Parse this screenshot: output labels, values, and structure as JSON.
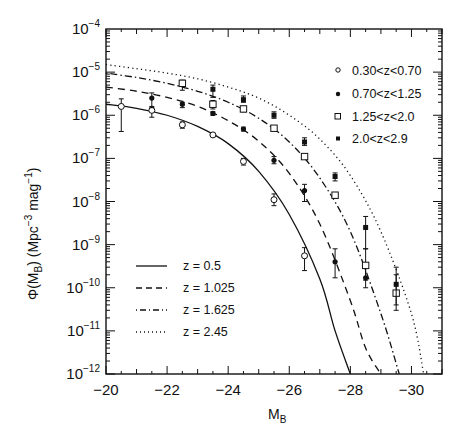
{
  "chart_data": {
    "type": "line",
    "title": "",
    "xlabel": "M_B",
    "ylabel": "Φ(M_B) (Mpc^-3 mag^-1)",
    "xlim": [
      -20,
      -31
    ],
    "ylim": [
      1e-12,
      0.0001
    ],
    "yscale": "log",
    "grid": false,
    "x_ticks": [
      -20,
      -22,
      -24,
      -26,
      -28,
      -30
    ],
    "y_ticks": [
      -12,
      -11,
      -10,
      -9,
      -8,
      -7,
      -6,
      -5,
      -4
    ],
    "model_curves": [
      {
        "name": "z = 0.5",
        "style": "solid",
        "x": [
          -20,
          -21,
          -22,
          -23,
          -24,
          -25,
          -26,
          -27,
          -27.5,
          -28
        ],
        "y": [
          1.8e-06,
          1.45e-06,
          1e-06,
          5.5e-07,
          2.2e-07,
          5e-08,
          5e-09,
          1.6e-10,
          1e-11,
          1e-12
        ]
      },
      {
        "name": "z = 1.025",
        "style": "dashed",
        "x": [
          -20,
          -21,
          -22,
          -23,
          -24,
          -25,
          -26,
          -27,
          -28,
          -28.5,
          -29.0
        ],
        "y": [
          4.5e-06,
          3.6e-06,
          2.6e-06,
          1.6e-06,
          7.5e-07,
          2.5e-07,
          4.5e-08,
          3e-09,
          5e-11,
          4e-12,
          1e-12
        ]
      },
      {
        "name": "z = 1.625",
        "style": "dashdot",
        "x": [
          -20,
          -21,
          -22,
          -23,
          -24,
          -25,
          -26,
          -27,
          -28,
          -29,
          -29.6
        ],
        "y": [
          9.5e-06,
          7.5e-06,
          5.5e-06,
          3.6e-06,
          2e-06,
          8.5e-07,
          2.4e-07,
          3.5e-08,
          2e-09,
          2.5e-11,
          1e-12
        ]
      },
      {
        "name": "z = 2.45",
        "style": "dotted",
        "x": [
          -20,
          -21,
          -22,
          -23,
          -24,
          -25,
          -26,
          -27,
          -28,
          -29,
          -30,
          -30.4
        ],
        "y": [
          1.5e-05,
          1.2e-05,
          9.5e-06,
          7e-06,
          4.5e-06,
          2.5e-06,
          1e-06,
          2.8e-07,
          4e-08,
          2e-09,
          2.5e-11,
          1e-12
        ]
      }
    ],
    "data_series": [
      {
        "name": "0.30<z<0.70",
        "marker": "open-circle",
        "x": [
          -20.5,
          -21.5,
          -22.5,
          -23.5,
          -24.5,
          -25.5,
          -26.5
        ],
        "y": [
          1.6e-06,
          1.3e-06,
          6e-07,
          3.5e-07,
          8.5e-08,
          1.1e-08,
          5.5e-10
        ],
        "err_lo": [
          4.2e-07,
          9e-07,
          5e-07,
          3.2e-07,
          7e-08,
          8e-09,
          2.5e-10
        ],
        "err_hi": [
          2.4e-06,
          1.6e-06,
          7e-07,
          3.8e-07,
          1e-07,
          1.5e-08,
          8.5e-10
        ]
      },
      {
        "name": "0.70<z<1.25",
        "marker": "filled-circle",
        "x": [
          -21.5,
          -22.5,
          -23.5,
          -24.5,
          -25.5,
          -26.5,
          -27.5,
          -28.5
        ],
        "y": [
          2.5e-06,
          1.8e-06,
          1.1e-06,
          4.8e-07,
          9e-08,
          1.8e-08,
          4e-10,
          1.7e-10
        ],
        "err_lo": [
          1.5e-06,
          1.5e-06,
          1e-06,
          4.3e-07,
          7.5e-08,
          1e-08,
          1.7e-10,
          1e-10
        ],
        "err_hi": [
          3.3e-06,
          2e-06,
          1.2e-06,
          5.3e-07,
          1.1e-07,
          2.5e-08,
          8e-10,
          3e-10
        ]
      },
      {
        "name": "1.25<z<2.0",
        "marker": "open-square",
        "x": [
          -22.5,
          -23.5,
          -24.5,
          -25.5,
          -26.5,
          -27.5,
          -28.5,
          -29.5
        ],
        "y": [
          5.5e-06,
          1.8e-06,
          1.4e-06,
          5e-07,
          1.1e-07,
          1.4e-08,
          3.3e-10,
          7.5e-11
        ],
        "err_lo": [
          3.8e-06,
          1.4e-06,
          1.2e-06,
          4.5e-07,
          1e-07,
          1.2e-08,
          1.5e-10,
          3e-11
        ],
        "err_hi": [
          6.5e-06,
          2.2e-06,
          1.6e-06,
          5.5e-07,
          1.2e-07,
          1.6e-08,
          8e-10,
          2e-10
        ]
      },
      {
        "name": "2.0<z<2.9",
        "marker": "filled-square",
        "x": [
          -23.5,
          -24.5,
          -25.5,
          -26.5,
          -27.5,
          -28.5,
          -29.5
        ],
        "y": [
          4e-06,
          2.3e-06,
          1e-06,
          2.4e-07,
          3.8e-08,
          2.5e-09,
          1.2e-10
        ],
        "err_lo": [
          2.6e-06,
          2e-06,
          8.5e-07,
          2e-07,
          3e-08,
          8e-10,
          4e-11
        ],
        "err_hi": [
          5e-06,
          2.8e-06,
          1.2e-06,
          3e-07,
          4.6e-08,
          4.5e-09,
          3e-10
        ]
      }
    ],
    "legends": {
      "markers_position": "upper right",
      "curves_position": "lower left"
    }
  },
  "labels": {
    "xlabel_main": "M",
    "xlabel_sub": "B",
    "ylabel_parts": [
      "Φ(M",
      "B",
      ") (Mpc",
      "−3",
      " mag",
      "−1",
      ")"
    ],
    "x_ticks": [
      "−20",
      "−22",
      "−24",
      "−26",
      "−28",
      "−30"
    ],
    "y_tick_base": "10",
    "y_tick_exps": [
      "−12",
      "−11",
      "−10",
      "−9",
      "−8",
      "−7",
      "−6",
      "−5",
      "−4"
    ],
    "marker_legend": [
      "0.30<z<0.70",
      "0.70<z<1.25",
      "1.25<z<2.0",
      "2.0<z<2.9"
    ],
    "curve_legend": [
      "z = 0.5",
      "z = 1.025",
      "z = 1.625",
      "z = 2.45"
    ]
  }
}
